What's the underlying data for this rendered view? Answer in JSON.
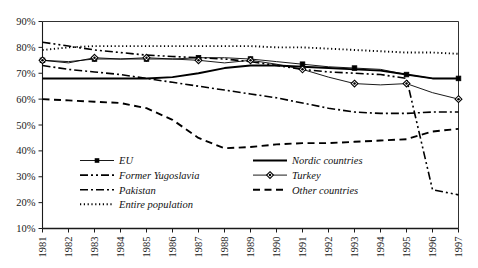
{
  "chart_data": {
    "type": "line",
    "title": "",
    "subtitle": "",
    "xlabel": "",
    "ylabel": "",
    "grid": false,
    "legend_position": "inside-bottom-left",
    "x": [
      1981,
      1982,
      1983,
      1984,
      1985,
      1986,
      1987,
      1988,
      1989,
      1990,
      1991,
      1992,
      1993,
      1994,
      1995,
      1996,
      1997
    ],
    "xtick_labels": [
      "1981",
      "1982",
      "1983",
      "1984",
      "1985",
      "1986",
      "1987",
      "1988",
      "1989",
      "1990",
      "1991",
      "1992",
      "1993",
      "1994",
      "1995",
      "1996",
      "1997"
    ],
    "xlim": [
      1981,
      1997
    ],
    "ylim": [
      10,
      90
    ],
    "ytick_labels": [
      "10%",
      "20%",
      "30%",
      "40%",
      "50%",
      "60%",
      "70%",
      "80%",
      "90%"
    ],
    "ytick_values": [
      10,
      20,
      30,
      40,
      50,
      60,
      70,
      80,
      90
    ],
    "series": [
      {
        "name": "EU",
        "style": "solid-marker-square",
        "marker": "square",
        "values": [
          75.0,
          74.5,
          75.5,
          75.5,
          75.5,
          75.5,
          76.0,
          76.0,
          75.5,
          74.5,
          73.5,
          72.5,
          72.0,
          71.5,
          69.5,
          68.0,
          68.0
        ]
      },
      {
        "name": "Former Yugoslavia",
        "style": "dash-dot-dot",
        "marker": "none",
        "values": [
          82.0,
          80.5,
          79.0,
          78.0,
          77.0,
          76.5,
          76.0,
          75.5,
          74.5,
          73.0,
          71.5,
          70.5,
          70.0,
          69.5,
          68.0,
          25.0,
          23.0
        ]
      },
      {
        "name": "Pakistan",
        "style": "dash-dot",
        "marker": "none",
        "values": [
          73.0,
          71.5,
          70.5,
          69.5,
          68.0,
          66.5,
          65.0,
          63.5,
          62.0,
          60.5,
          58.5,
          56.5,
          55.0,
          54.5,
          54.5,
          55.0,
          55.0
        ]
      },
      {
        "name": "Entire population",
        "style": "dotted",
        "marker": "none",
        "values": [
          79.0,
          80.0,
          80.5,
          80.5,
          80.5,
          80.5,
          80.5,
          80.5,
          80.5,
          80.0,
          80.0,
          79.5,
          79.0,
          78.5,
          78.0,
          78.0,
          77.5
        ]
      },
      {
        "name": "Nordic countries",
        "style": "solid-thick",
        "marker": "none",
        "values": [
          68.0,
          68.0,
          68.0,
          68.0,
          68.0,
          68.5,
          70.0,
          72.0,
          73.0,
          73.0,
          72.5,
          72.0,
          71.5,
          71.0,
          69.5,
          68.0,
          68.0
        ]
      },
      {
        "name": "Turkey",
        "style": "solid-marker-diamond",
        "marker": "diamond",
        "values": [
          75.0,
          74.0,
          76.0,
          75.5,
          76.0,
          75.5,
          75.0,
          74.0,
          75.0,
          73.5,
          71.5,
          68.5,
          66.0,
          65.5,
          66.0,
          62.5,
          60.0
        ]
      },
      {
        "name": "Other countries",
        "style": "dashed",
        "marker": "none",
        "values": [
          60.0,
          59.5,
          59.0,
          58.5,
          56.5,
          52.0,
          45.0,
          41.0,
          41.5,
          42.5,
          43.0,
          43.0,
          43.5,
          44.0,
          44.5,
          47.5,
          48.5
        ]
      }
    ]
  },
  "legend": {
    "column_left": [
      {
        "label": "EU",
        "key": "EU"
      },
      {
        "label": "Former Yugoslavia",
        "key": "Former Yugoslavia"
      },
      {
        "label": "Pakistan",
        "key": "Pakistan"
      },
      {
        "label": "Entire population",
        "key": "Entire population"
      }
    ],
    "column_right": [
      {
        "label": "Nordic countries",
        "key": "Nordic countries"
      },
      {
        "label": "Turkey",
        "key": "Turkey"
      },
      {
        "label": "Other countries",
        "key": "Other countries"
      }
    ]
  },
  "colors": {
    "line": "#000000",
    "axis": "#1a1a1a",
    "text": "#111111",
    "background": "#ffffff"
  }
}
